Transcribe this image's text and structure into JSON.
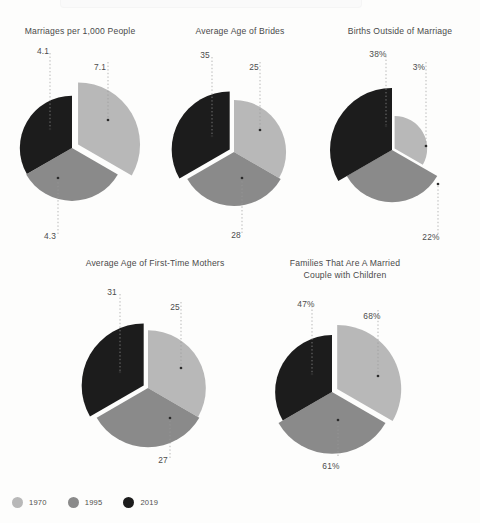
{
  "background": "#fdfdfc",
  "series_colors": {
    "1970": "#b8b8b8",
    "1995": "#8a8a8a",
    "2019": "#1c1c1c"
  },
  "legend": {
    "position": "bottom-left",
    "items": [
      {
        "label": "1970",
        "color": "#b8b8b8",
        "icon": "circle-swatch"
      },
      {
        "label": "1995",
        "color": "#8a8a8a",
        "icon": "circle-swatch"
      },
      {
        "label": "2019",
        "color": "#1c1c1c",
        "icon": "circle-swatch"
      }
    ]
  },
  "panels": [
    {
      "id": "marriages",
      "title": "Marriages per 1,000 People",
      "labels": {
        "a": "7.1",
        "b": "4.3",
        "c": "4.1"
      }
    },
    {
      "id": "brides",
      "title": "Average Age of Brides",
      "labels": {
        "a": "25",
        "b": "28",
        "c": "35"
      }
    },
    {
      "id": "births",
      "title": "Births Outside of Marriage",
      "labels": {
        "a": "3%",
        "b": "22%",
        "c": "38%"
      }
    },
    {
      "id": "mothers",
      "title": "Average Age of First-Time Mothers",
      "labels": {
        "a": "25",
        "b": "27",
        "c": "31"
      }
    },
    {
      "id": "families",
      "title": "Families That Are A Married\nCouple with Children",
      "labels": {
        "a": "68%",
        "b": "61%",
        "c": "47%"
      }
    }
  ],
  "chart_data": [
    {
      "type": "pie",
      "title": "Marriages per 1,000 People",
      "subtitle": "",
      "xlabel": "",
      "ylabel": "",
      "unit": "marriages per 1,000 people",
      "legend_position": "bottom-left",
      "grid": false,
      "note": "Nightingale/rose style: three equal 120-degree wedges with radius proportional to value; largest wedge exploded outward.",
      "categories": [
        "1970",
        "1995",
        "2019"
      ],
      "values": [
        7.1,
        4.3,
        4.1
      ],
      "labels": [
        "7.1",
        "4.3",
        "4.1"
      ],
      "colors": [
        "#b8b8b8",
        "#8a8a8a",
        "#1c1c1c"
      ]
    },
    {
      "type": "pie",
      "title": "Average Age of Brides",
      "subtitle": "",
      "xlabel": "",
      "ylabel": "",
      "unit": "years",
      "legend_position": "bottom-left",
      "grid": false,
      "note": "Three equal 120-degree wedges with radius proportional to value; largest wedge exploded outward.",
      "categories": [
        "1970",
        "1995",
        "2019"
      ],
      "values": [
        25,
        28,
        35
      ],
      "labels": [
        "25",
        "28",
        "35"
      ],
      "colors": [
        "#b8b8b8",
        "#8a8a8a",
        "#1c1c1c"
      ]
    },
    {
      "type": "pie",
      "title": "Births Outside of Marriage",
      "subtitle": "",
      "xlabel": "",
      "ylabel": "",
      "unit": "percent",
      "legend_position": "bottom-left",
      "grid": false,
      "note": "Three equal 120-degree wedges with radius proportional to value; largest wedge exploded outward.",
      "categories": [
        "1970",
        "1995",
        "2019"
      ],
      "values": [
        3,
        22,
        38
      ],
      "labels": [
        "3%",
        "22%",
        "38%"
      ],
      "colors": [
        "#b8b8b8",
        "#8a8a8a",
        "#1c1c1c"
      ]
    },
    {
      "type": "pie",
      "title": "Average Age of First-Time Mothers",
      "subtitle": "",
      "xlabel": "",
      "ylabel": "",
      "unit": "years",
      "legend_position": "bottom-left",
      "grid": false,
      "note": "Three equal 120-degree wedges with radius proportional to value; largest wedge exploded outward.",
      "categories": [
        "1970",
        "1995",
        "2019"
      ],
      "values": [
        25,
        27,
        31
      ],
      "labels": [
        "25",
        "27",
        "31"
      ],
      "colors": [
        "#b8b8b8",
        "#8a8a8a",
        "#1c1c1c"
      ]
    },
    {
      "type": "pie",
      "title": "Families That Are A Married Couple with Children",
      "subtitle": "",
      "xlabel": "",
      "ylabel": "",
      "unit": "percent",
      "legend_position": "bottom-left",
      "grid": false,
      "note": "Three equal 120-degree wedges with radius proportional to value; largest wedge exploded outward.",
      "categories": [
        "1970",
        "1995",
        "2019"
      ],
      "values": [
        68,
        61,
        47
      ],
      "labels": [
        "68%",
        "61%",
        "47%"
      ],
      "colors": [
        "#b8b8b8",
        "#8a8a8a",
        "#1c1c1c"
      ]
    }
  ]
}
